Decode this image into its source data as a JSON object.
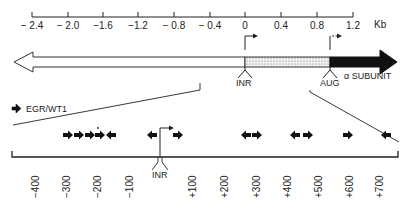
{
  "top_scale": {
    "unit": "Kb",
    "ticks": [
      {
        "label": "− 2.4",
        "x": 32
      },
      {
        "label": "− 2.0",
        "x": 68
      },
      {
        "label": "−1.6",
        "x": 103
      },
      {
        "label": "−1.2",
        "x": 138
      },
      {
        "label": "− 0.8",
        "x": 174
      },
      {
        "label": "− 0.4",
        "x": 210
      },
      {
        "label": "0",
        "x": 245
      },
      {
        "label": "0.4",
        "x": 281
      },
      {
        "label": "0.8",
        "x": 317
      },
      {
        "label": "1.2",
        "x": 353
      }
    ]
  },
  "gene_map": {
    "inr_label": "INR",
    "aug_label": "AUG",
    "gene_label": "α SUBUNIT"
  },
  "legend": {
    "label": "EGR/WT1"
  },
  "detail": {
    "inr_label": "INR",
    "ticks": [
      {
        "label": "−400",
        "x": 35
      },
      {
        "label": "−300",
        "x": 66
      },
      {
        "label": "−200",
        "x": 97
      },
      {
        "label": "−100",
        "x": 129
      },
      {
        "label": "+100",
        "x": 192
      },
      {
        "label": "+200",
        "x": 224
      },
      {
        "label": "+300",
        "x": 256
      },
      {
        "label": "+400",
        "x": 287
      },
      {
        "label": "+500",
        "x": 318
      },
      {
        "label": "+600",
        "x": 349
      },
      {
        "label": "+700",
        "x": 379
      }
    ],
    "sites": [
      {
        "x": 68,
        "dir": "right"
      },
      {
        "x": 79,
        "dir": "right"
      },
      {
        "x": 90,
        "dir": "right"
      },
      {
        "x": 100,
        "dir": "right"
      },
      {
        "x": 111,
        "dir": "left"
      },
      {
        "x": 152,
        "dir": "left"
      },
      {
        "x": 178,
        "dir": "right"
      },
      {
        "x": 246,
        "dir": "left"
      },
      {
        "x": 257,
        "dir": "right"
      },
      {
        "x": 295,
        "dir": "left"
      },
      {
        "x": 308,
        "dir": "right"
      },
      {
        "x": 348,
        "dir": "right"
      },
      {
        "x": 386,
        "dir": "left"
      }
    ]
  }
}
